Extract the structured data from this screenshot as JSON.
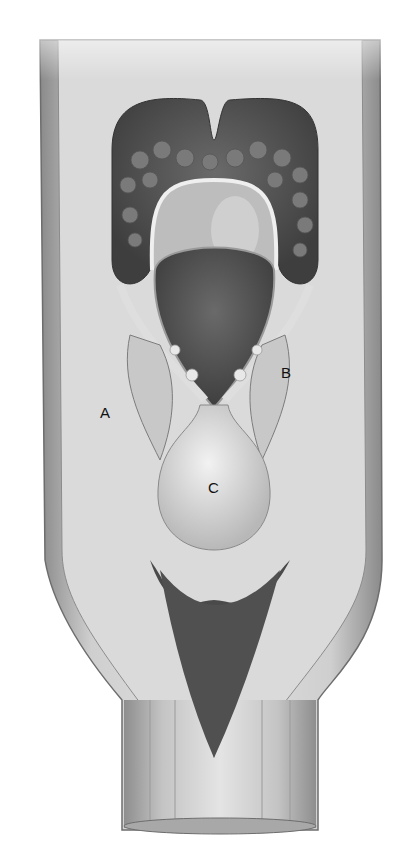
{
  "figure": {
    "style": "grayscale medical illustration",
    "labels": [
      {
        "id": "A",
        "text": "A"
      },
      {
        "id": "B",
        "text": "B"
      },
      {
        "id": "C",
        "text": "C"
      }
    ]
  }
}
